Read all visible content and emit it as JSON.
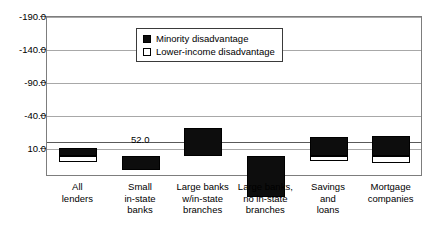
{
  "chart_data": {
    "type": "bar",
    "title": "",
    "subtitle": "",
    "xlabel": "",
    "ylabel": "",
    "ylim": [
      10.0,
      -190.0
    ],
    "y_axis_inverted": true,
    "grid": true,
    "legend_position": "top-center",
    "yticks": [
      "-190.0",
      "-140.0",
      "-90.0",
      "-40.0",
      "10.0"
    ],
    "ytick_values": [
      -190.0,
      -140.0,
      -90.0,
      -40.0,
      10.0
    ],
    "categories": [
      "All lenders",
      "Small in-state banks",
      "Large banks w/in-state branches",
      "Large banks, no in-state branches",
      "Savings and loans",
      "Mortgage companies"
    ],
    "category_lines": [
      [
        "All",
        "lenders"
      ],
      [
        "Small",
        "in-state",
        "banks"
      ],
      [
        "Large banks",
        "w/in-state",
        "branches"
      ],
      [
        "Large banks,",
        "no in-state",
        "branches"
      ],
      [
        "Savings",
        "and",
        "loans"
      ],
      [
        "Mortgage",
        "companies"
      ]
    ],
    "series": [
      {
        "name": "Minority disadvantage",
        "color": "#0d0d0d",
        "fill": "solid",
        "values": [
          12.0,
          -22.0,
          42.0,
          -62.0,
          28.0,
          30.0
        ]
      },
      {
        "name": "Lower-income disadvantage",
        "color": "#ffffff",
        "fill": "hollow",
        "values": [
          -9.0,
          0.0,
          0.0,
          -60.0,
          -8.0,
          -11.0
        ]
      }
    ],
    "annotations": [
      {
        "text": "52.0",
        "category": "Small in-state banks",
        "value": 32.0
      }
    ]
  },
  "legend": {
    "items": [
      {
        "label": "Minority disadvantage",
        "swatch": "filled-square-icon"
      },
      {
        "label": "Lower-income disadvantage",
        "swatch": "hollow-square-icon"
      }
    ]
  }
}
